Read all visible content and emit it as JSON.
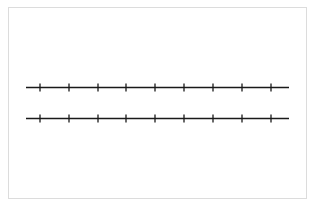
{
  "diagram": {
    "type": "number-lines",
    "frame": {
      "x": 8,
      "y": 7,
      "width": 299,
      "height": 192,
      "border_color": "#dcdcdc"
    },
    "line_color": "#1a1a1a",
    "lines": [
      {
        "name": "number-line-top",
        "y": 87.5,
        "x_start": 26,
        "x_end": 289,
        "tick_positions": [
          40,
          69,
          98,
          126,
          155,
          184,
          213,
          242,
          271
        ],
        "tick_half_length": 4
      },
      {
        "name": "number-line-bottom",
        "y": 118.5,
        "x_start": 26,
        "x_end": 289,
        "tick_positions": [
          40,
          69,
          98,
          126,
          155,
          184,
          213,
          242,
          271
        ],
        "tick_half_length": 4
      }
    ],
    "tick_count_per_line": 9
  }
}
